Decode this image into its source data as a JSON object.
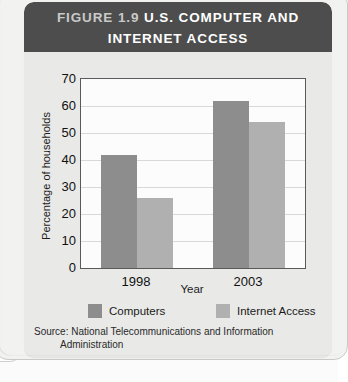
{
  "figure": {
    "number": "FIGURE 1.9",
    "title": "U.S. COMPUTER AND INTERNET ACCESS",
    "title_line1": "U.S. COMPUTER AND",
    "title_line2": "INTERNET ACCESS",
    "source_line1": "Source: National Telecommunications and Information",
    "source_line2": "Administration"
  },
  "colors": {
    "header_background": "#4d4d4d",
    "panel_background": "#e9e9e7",
    "plot_background": "#fcfcfc",
    "computers_bar": "#8d8d8d",
    "internet_bar": "#b0b0b0",
    "gridline": "#d8d8d8",
    "axis": "#5a5a5a"
  },
  "chart_data": {
    "type": "bar",
    "title": "U.S. COMPUTER AND INTERNET ACCESS",
    "categories": [
      "1998",
      "2003"
    ],
    "series": [
      {
        "name": "Computers",
        "values": [
          42,
          62
        ],
        "color": "#8d8d8d"
      },
      {
        "name": "Internet Access",
        "values": [
          26,
          54
        ],
        "color": "#b0b0b0"
      }
    ],
    "xlabel": "Year",
    "ylabel": "Percentage of households",
    "ylim": [
      0,
      70
    ],
    "ytick_labels": [
      "70",
      "60",
      "50",
      "40",
      "30",
      "20",
      "10",
      "0"
    ],
    "ytick_values": [
      70,
      60,
      50,
      40,
      30,
      20,
      10,
      0
    ],
    "grid": true,
    "legend_position": "bottom",
    "legend": [
      "Computers",
      "Internet Access"
    ]
  }
}
